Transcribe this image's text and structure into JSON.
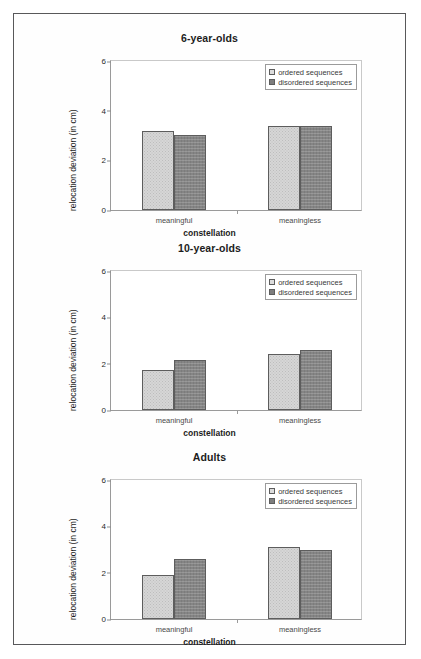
{
  "figure": {
    "axis_label_x": "constellation",
    "axis_label_y": "relocation deviation (in cm)",
    "legend": {
      "ordered_label": "ordered sequences",
      "disordered_label": "disordered sequences"
    },
    "colors": {
      "ordered": "#d6d6d6",
      "disordered": "#858585",
      "border": "#58585a",
      "axis": "#9a9a9a"
    },
    "yticks": [
      "0",
      "2",
      "4",
      "6"
    ]
  },
  "chart_data": [
    {
      "type": "bar",
      "title": "6-year-olds",
      "xlabel": "constellation",
      "ylabel": "relocation deviation (in cm)",
      "categories": [
        "meaningful",
        "meaningless"
      ],
      "ylim": [
        0,
        6
      ],
      "ytick_values": [
        0,
        2,
        4,
        6
      ],
      "grid": false,
      "legend_position": "top-right",
      "series": [
        {
          "name": "ordered sequences",
          "values": [
            3.14,
            3.34
          ]
        },
        {
          "name": "disordered sequences",
          "values": [
            2.98,
            3.34
          ]
        }
      ]
    },
    {
      "type": "bar",
      "title": "10-year-olds",
      "xlabel": "constellation",
      "ylabel": "relocation deviation (in cm)",
      "categories": [
        "meaningful",
        "meaningless"
      ],
      "ylim": [
        0,
        6
      ],
      "ytick_values": [
        0,
        2,
        4,
        6
      ],
      "grid": false,
      "legend_position": "top-right",
      "series": [
        {
          "name": "ordered sequences",
          "values": [
            1.72,
            2.4
          ]
        },
        {
          "name": "disordered sequences",
          "values": [
            2.12,
            2.57
          ]
        }
      ]
    },
    {
      "type": "bar",
      "title": "Adults",
      "xlabel": "constellation",
      "ylabel": "relocation deviation (in cm)",
      "categories": [
        "meaningful",
        "meaningless"
      ],
      "ylim": [
        0,
        6
      ],
      "ytick_values": [
        0,
        2,
        4,
        6
      ],
      "grid": false,
      "legend_position": "top-right",
      "series": [
        {
          "name": "ordered sequences",
          "values": [
            1.87,
            3.07
          ]
        },
        {
          "name": "disordered sequences",
          "values": [
            2.55,
            2.93
          ]
        }
      ]
    }
  ]
}
